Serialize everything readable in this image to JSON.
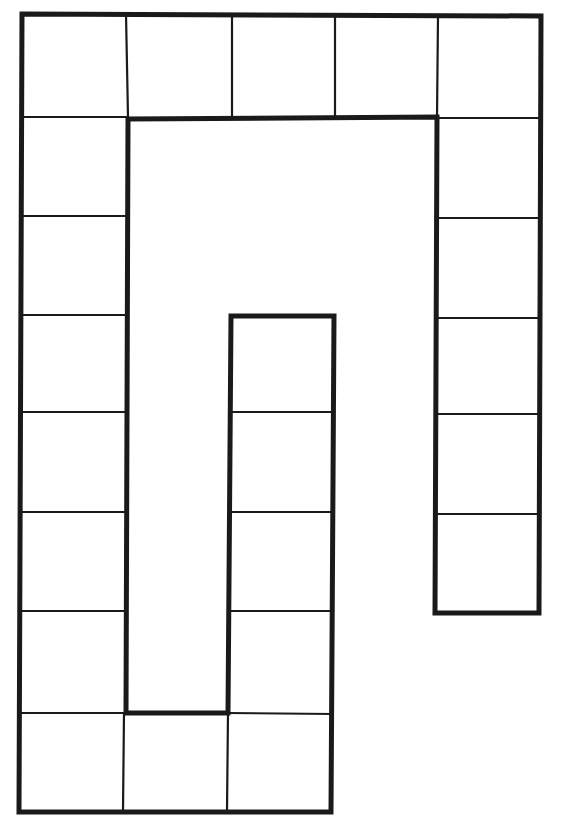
{
  "diagram": {
    "type": "board-game-path",
    "colors": {
      "background": "#ffffff",
      "line": "#1a1a1a"
    },
    "stroke": {
      "outline": 5,
      "divider": 2.2
    },
    "outline_path": "M22,14 L541,16 L539,613 L435,613 L437,117 L128,119 L126,713 L228,713 L231,316 L334,316 L331,812 L19,812 Z",
    "cells": [
      {
        "id": 1,
        "section": "bottom-row",
        "x": 230,
        "y": 713,
        "w": 102,
        "h": 99
      },
      {
        "id": 2,
        "section": "bottom-row",
        "x": 124,
        "y": 713,
        "w": 106,
        "h": 99
      },
      {
        "id": 3,
        "section": "bottom-row",
        "x": 19,
        "y": 713,
        "w": 105,
        "h": 99
      },
      {
        "id": 4,
        "section": "left-column",
        "x": 21,
        "y": 611,
        "w": 104,
        "h": 102
      },
      {
        "id": 5,
        "section": "left-column",
        "x": 21,
        "y": 512,
        "w": 104,
        "h": 99
      },
      {
        "id": 6,
        "section": "left-column",
        "x": 22,
        "y": 412,
        "w": 104,
        "h": 100
      },
      {
        "id": 7,
        "section": "left-column",
        "x": 22,
        "y": 315,
        "w": 104,
        "h": 97
      },
      {
        "id": 8,
        "section": "left-column",
        "x": 22,
        "y": 216,
        "w": 104,
        "h": 99
      },
      {
        "id": 9,
        "section": "left-column",
        "x": 22,
        "y": 117,
        "w": 104,
        "h": 99
      },
      {
        "id": 10,
        "section": "top-row",
        "x": 22,
        "y": 14,
        "w": 104,
        "h": 103
      },
      {
        "id": 11,
        "section": "top-row",
        "x": 126,
        "y": 14,
        "w": 106,
        "h": 104
      },
      {
        "id": 12,
        "section": "top-row",
        "x": 232,
        "y": 15,
        "w": 103,
        "h": 103
      },
      {
        "id": 13,
        "section": "top-row",
        "x": 335,
        "y": 15,
        "w": 103,
        "h": 103
      },
      {
        "id": 14,
        "section": "top-row",
        "x": 438,
        "y": 16,
        "w": 103,
        "h": 102
      },
      {
        "id": 15,
        "section": "right-column",
        "x": 438,
        "y": 118,
        "w": 102,
        "h": 100
      },
      {
        "id": 16,
        "section": "right-column",
        "x": 438,
        "y": 218,
        "w": 102,
        "h": 100
      },
      {
        "id": 17,
        "section": "right-column",
        "x": 437,
        "y": 318,
        "w": 102,
        "h": 96
      },
      {
        "id": 18,
        "section": "right-column",
        "x": 437,
        "y": 414,
        "w": 102,
        "h": 100
      },
      {
        "id": 19,
        "section": "right-column",
        "x": 437,
        "y": 514,
        "w": 102,
        "h": 99
      },
      {
        "id": 20,
        "section": "middle-column",
        "x": 231,
        "y": 316,
        "w": 103,
        "h": 96
      },
      {
        "id": 21,
        "section": "middle-column",
        "x": 231,
        "y": 412,
        "w": 103,
        "h": 100
      },
      {
        "id": 22,
        "section": "middle-column",
        "x": 230,
        "y": 512,
        "w": 103,
        "h": 99
      },
      {
        "id": 23,
        "section": "middle-column",
        "x": 230,
        "y": 611,
        "w": 102,
        "h": 102
      }
    ],
    "dividers": [
      {
        "x1": 126,
        "y1": 14,
        "x2": 128,
        "y2": 117
      },
      {
        "x1": 232,
        "y1": 15,
        "x2": 232,
        "y2": 118
      },
      {
        "x1": 335,
        "y1": 15,
        "x2": 335,
        "y2": 118
      },
      {
        "x1": 438,
        "y1": 16,
        "x2": 437,
        "y2": 118
      },
      {
        "x1": 22,
        "y1": 117,
        "x2": 126,
        "y2": 117
      },
      {
        "x1": 22,
        "y1": 216,
        "x2": 126,
        "y2": 216
      },
      {
        "x1": 22,
        "y1": 315,
        "x2": 126,
        "y2": 315
      },
      {
        "x1": 22,
        "y1": 412,
        "x2": 126,
        "y2": 412
      },
      {
        "x1": 21,
        "y1": 512,
        "x2": 126,
        "y2": 512
      },
      {
        "x1": 21,
        "y1": 611,
        "x2": 125,
        "y2": 611
      },
      {
        "x1": 20,
        "y1": 713,
        "x2": 126,
        "y2": 713
      },
      {
        "x1": 437,
        "y1": 118,
        "x2": 540,
        "y2": 118
      },
      {
        "x1": 437,
        "y1": 218,
        "x2": 540,
        "y2": 218
      },
      {
        "x1": 437,
        "y1": 318,
        "x2": 540,
        "y2": 318
      },
      {
        "x1": 436,
        "y1": 414,
        "x2": 539,
        "y2": 414
      },
      {
        "x1": 436,
        "y1": 514,
        "x2": 539,
        "y2": 514
      },
      {
        "x1": 231,
        "y1": 412,
        "x2": 334,
        "y2": 412
      },
      {
        "x1": 230,
        "y1": 512,
        "x2": 333,
        "y2": 512
      },
      {
        "x1": 230,
        "y1": 611,
        "x2": 333,
        "y2": 611
      },
      {
        "x1": 228,
        "y1": 713,
        "x2": 332,
        "y2": 714
      },
      {
        "x1": 124,
        "y1": 713,
        "x2": 123,
        "y2": 812
      },
      {
        "x1": 228,
        "y1": 713,
        "x2": 227,
        "y2": 812
      }
    ]
  }
}
